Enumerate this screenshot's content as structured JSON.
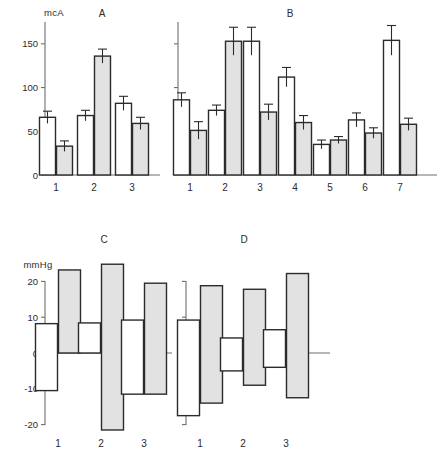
{
  "figure": {
    "panels": [
      "A",
      "B",
      "C",
      "D"
    ],
    "colors": {
      "open_bar_fill": "#ffffff",
      "filled_bar_fill": "#e2e2e2",
      "stroke": "#2b2b2b",
      "axis": "#6e6e6e"
    }
  },
  "chart_data": [
    {
      "type": "bar",
      "title": "A",
      "ylabel": "mcA",
      "xlabel": "",
      "ylim": [
        0,
        175
      ],
      "yticks": [
        0,
        50,
        100,
        150
      ],
      "ytick_labels": [
        "0",
        "50",
        "100",
        "150"
      ],
      "categories": [
        "1",
        "2",
        "3"
      ],
      "grid": false,
      "legend": "none",
      "series": [
        {
          "name": "open",
          "values": [
            66,
            68,
            82
          ],
          "errors": [
            7,
            6,
            8
          ]
        },
        {
          "name": "filled",
          "values": [
            33,
            136,
            59
          ],
          "errors": [
            6,
            8,
            7
          ]
        }
      ]
    },
    {
      "type": "bar",
      "title": "B",
      "ylabel": "mcA",
      "xlabel": "",
      "ylim": [
        0,
        175
      ],
      "yticks": [
        0,
        50,
        100,
        150
      ],
      "ytick_labels": [
        "",
        "",
        "",
        ""
      ],
      "categories": [
        "1",
        "2",
        "3",
        "4",
        "5",
        "6",
        "7"
      ],
      "grid": false,
      "legend": "none",
      "series": [
        {
          "name": "open",
          "values": [
            86,
            74,
            153,
            112,
            35,
            63,
            154
          ],
          "errors": [
            8,
            6,
            16,
            11,
            5,
            8,
            17
          ]
        },
        {
          "name": "filled",
          "values": [
            51,
            153,
            72,
            60,
            40,
            48,
            58
          ],
          "errors": [
            10,
            16,
            9,
            8,
            4,
            6,
            7
          ]
        }
      ]
    },
    {
      "type": "bar",
      "title": "C",
      "ylabel": "mmHg",
      "xlabel": "",
      "ylim": [
        -24,
        26
      ],
      "yticks": [
        20,
        10,
        0,
        -10,
        -20
      ],
      "ytick_labels": [
        "20",
        "10",
        "0",
        "-10",
        "-20"
      ],
      "categories": [
        "1",
        "2",
        "3"
      ],
      "grid": false,
      "legend": "none",
      "note": "floating range bars spanning negative to positive",
      "series": [
        {
          "name": "open",
          "low": [
            -10.5,
            0.0,
            -11.5
          ],
          "high": [
            8.2,
            8.4,
            9.2
          ]
        },
        {
          "name": "filled",
          "low": [
            0.0,
            -21.5,
            -11.5
          ],
          "high": [
            23.2,
            24.8,
            19.5
          ]
        }
      ]
    },
    {
      "type": "bar",
      "title": "D",
      "ylabel": "mmHg",
      "xlabel": "",
      "ylim": [
        -24,
        26
      ],
      "yticks": [
        20,
        10,
        0,
        -10,
        -20
      ],
      "ytick_labels": [
        "",
        "",
        "",
        "",
        ""
      ],
      "categories": [
        "1",
        "2",
        "3"
      ],
      "grid": false,
      "legend": "none",
      "note": "floating range bars spanning negative to positive",
      "series": [
        {
          "name": "open",
          "low": [
            -17.5,
            -5.0,
            -4.0
          ],
          "high": [
            9.2,
            4.2,
            6.5
          ]
        },
        {
          "name": "filled",
          "low": [
            -14.0,
            -9.0,
            -12.5
          ],
          "high": [
            18.8,
            17.8,
            22.2
          ]
        }
      ]
    }
  ]
}
